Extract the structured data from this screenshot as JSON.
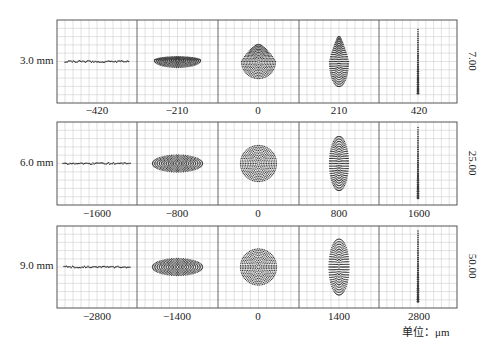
{
  "figure": {
    "unit_label": "单位：μm",
    "grid_color": "#cfcfcf",
    "frame_color": "#555555",
    "spot_color": "#3a3a3a"
  },
  "chart_data": {
    "type": "scatter",
    "xlabel": "单位：μm",
    "rows": [
      {
        "label": "3.0 mm",
        "side_value": "7.00",
        "ticks": [
          "−420",
          "−210",
          "0",
          "210",
          "420"
        ],
        "spots": [
          {
            "shape": "line-h",
            "w": 64,
            "h": 3
          },
          {
            "shape": "half-ellipse-h",
            "w": 46,
            "h": 14
          },
          {
            "shape": "drop-round",
            "w": 34,
            "h": 34
          },
          {
            "shape": "tear-v",
            "w": 19,
            "h": 50
          },
          {
            "shape": "line-v",
            "w": 3,
            "h": 64
          }
        ]
      },
      {
        "label": "6.0 mm",
        "side_value": "25.00",
        "ticks": [
          "−1600",
          "−800",
          "0",
          "800",
          "1600"
        ],
        "spots": [
          {
            "shape": "line-h",
            "w": 68,
            "h": 3
          },
          {
            "shape": "ellipse-h",
            "w": 50,
            "h": 17
          },
          {
            "shape": "circle",
            "w": 36,
            "h": 36
          },
          {
            "shape": "ellipse-v",
            "w": 19,
            "h": 54
          },
          {
            "shape": "line-v",
            "w": 3,
            "h": 72
          }
        ]
      },
      {
        "label": "9.0 mm",
        "side_value": "50.00",
        "ticks": [
          "−2800",
          "−1400",
          "0",
          "1400",
          "2800"
        ],
        "spots": [
          {
            "shape": "line-h",
            "w": 66,
            "h": 3
          },
          {
            "shape": "ellipse-h",
            "w": 50,
            "h": 17
          },
          {
            "shape": "circle",
            "w": 36,
            "h": 36
          },
          {
            "shape": "ellipse-v",
            "w": 20,
            "h": 56
          },
          {
            "shape": "line-v",
            "w": 3,
            "h": 72
          }
        ]
      }
    ]
  }
}
